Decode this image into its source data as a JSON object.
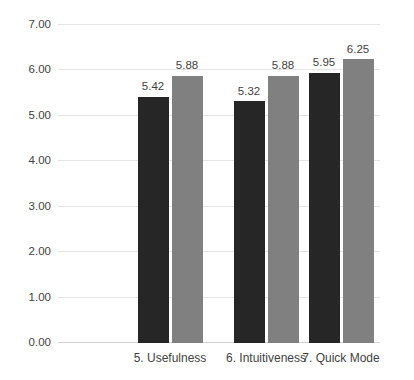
{
  "chart_data": {
    "type": "bar",
    "title": "",
    "xlabel": "",
    "ylabel": "",
    "ylim": [
      0,
      7
    ],
    "ytick_step": 1,
    "ytick_labels": [
      "7.00",
      "6.00",
      "5.00",
      "4.00",
      "3.00",
      "2.00",
      "1.00",
      "0.00"
    ],
    "ytick_values": [
      7,
      6,
      5,
      4,
      3,
      2,
      1,
      0
    ],
    "grid": "horizontal",
    "legend": "none-visible",
    "categories": [
      "5. Usefulness",
      "6. Intuitiveness",
      "7. Quick Mode"
    ],
    "series": [
      {
        "name": "series-a",
        "color": "#262626",
        "values": [
          5.42,
          5.32,
          5.95
        ],
        "labels": [
          "5.42",
          "5.32",
          "5.95"
        ]
      },
      {
        "name": "series-b",
        "color": "#808080",
        "values": [
          5.88,
          5.88,
          6.25
        ],
        "labels": [
          "5.88",
          "5.88",
          "6.25"
        ]
      }
    ]
  },
  "axes": {
    "y_ticks": [
      {
        "label": "7.00",
        "value": 7
      },
      {
        "label": "6.00",
        "value": 6
      },
      {
        "label": "5.00",
        "value": 5
      },
      {
        "label": "4.00",
        "value": 4
      },
      {
        "label": "3.00",
        "value": 3
      },
      {
        "label": "2.00",
        "value": 2
      },
      {
        "label": "1.00",
        "value": 1
      },
      {
        "label": "0.00",
        "value": 0
      }
    ],
    "x_categories": [
      {
        "label": "5. Usefulness"
      },
      {
        "label": "6. Intuitiveness"
      },
      {
        "label": "7. Quick Mode"
      }
    ]
  },
  "bars": [
    {
      "group": 0,
      "series": 0,
      "label": "5.42",
      "value": 5.42
    },
    {
      "group": 0,
      "series": 1,
      "label": "5.88",
      "value": 5.88
    },
    {
      "group": 1,
      "series": 0,
      "label": "5.32",
      "value": 5.32
    },
    {
      "group": 1,
      "series": 1,
      "label": "5.88",
      "value": 5.88
    },
    {
      "group": 2,
      "series": 0,
      "label": "5.95",
      "value": 5.95
    },
    {
      "group": 2,
      "series": 1,
      "label": "6.25",
      "value": 6.25
    }
  ],
  "top_clip": {
    "text": ""
  },
  "colors": {
    "series_a": "#262626",
    "series_b": "#808080",
    "gridline": "#e4e4e4",
    "baseline": "#d2d2d2",
    "text": "#3f3f3f",
    "background": "#ffffff"
  }
}
